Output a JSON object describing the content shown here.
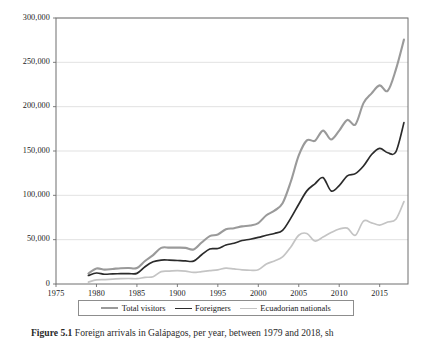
{
  "figure": {
    "caption_label": "Figure 5.1",
    "caption_text": "Foreign arrivals in Galápagos, per year, between 1979 and 2018, sh"
  },
  "legend": {
    "position": "below-axis",
    "boxed": true,
    "entries": [
      {
        "label": "Total visitors",
        "color": "#9a9a9a"
      },
      {
        "label": "Foreigners",
        "color": "#2b2b2b"
      },
      {
        "label": "Ecuadorian nationals",
        "color": "#c4c4c4"
      }
    ]
  },
  "chart_data": {
    "type": "line",
    "title": "",
    "xlabel": "",
    "ylabel": "",
    "xlim": [
      1975,
      2018.5
    ],
    "ylim": [
      0,
      300000
    ],
    "grid": "horizontal",
    "xticks": [
      1975,
      1980,
      1985,
      1990,
      1995,
      2000,
      2005,
      2010,
      2015
    ],
    "xtick_labels": [
      "1975",
      "1980",
      "1985",
      "1900",
      "1995",
      "2000",
      "2005",
      "2010",
      "2015"
    ],
    "yticks": [
      0,
      50000,
      100000,
      150000,
      200000,
      250000,
      300000
    ],
    "ytick_labels": [
      "0",
      "50,000",
      "100,000",
      "150,000",
      "200,000",
      "250,000",
      "300,000"
    ],
    "x": [
      1979,
      1980,
      1981,
      1982,
      1983,
      1984,
      1985,
      1986,
      1987,
      1988,
      1989,
      1990,
      1991,
      1992,
      1993,
      1994,
      1995,
      1996,
      1997,
      1998,
      1999,
      2000,
      2001,
      2002,
      2003,
      2004,
      2005,
      2006,
      2007,
      2008,
      2009,
      2010,
      2011,
      2012,
      2013,
      2014,
      2015,
      2016,
      2017,
      2018
    ],
    "series": [
      {
        "name": "Total visitors",
        "color": "#9a9a9a",
        "width": 2.1,
        "values": [
          11765,
          17445,
          16265,
          17000,
          17800,
          18000,
          18000,
          26000,
          32595,
          40745,
          41000,
          41000,
          40765,
          39000,
          46800,
          54000,
          55800,
          61800,
          62800,
          65000,
          66000,
          68765,
          77500,
          82765,
          91000,
          115000,
          145000,
          162000,
          161500,
          173000,
          163000,
          173000,
          185000,
          180000,
          204000,
          215000,
          224000,
          218000,
          241800,
          275600
        ]
      },
      {
        "name": "Foreigners",
        "color": "#2b2b2b",
        "width": 1.7,
        "values": [
          9600,
          12400,
          11000,
          11500,
          11600,
          11800,
          12000,
          19500,
          25000,
          27000,
          27000,
          26500,
          26000,
          25800,
          33000,
          39500,
          40000,
          44000,
          46000,
          49000,
          50500,
          52500,
          55000,
          57000,
          60500,
          74000,
          90000,
          105000,
          113000,
          120000,
          105000,
          111000,
          122000,
          124500,
          133000,
          146000,
          153000,
          148000,
          149000,
          182000
        ]
      },
      {
        "name": "Ecuadorian nationals",
        "color": "#c4c4c4",
        "width": 1.7,
        "values": [
          2100,
          4600,
          5000,
          5500,
          6000,
          6200,
          6000,
          7500,
          8200,
          14000,
          14500,
          15000,
          14500,
          13000,
          14000,
          15000,
          16000,
          18000,
          17000,
          16000,
          15500,
          16000,
          22500,
          26000,
          30500,
          41500,
          55000,
          57000,
          48500,
          53000,
          58000,
          62000,
          63000,
          55000,
          71000,
          69000,
          66500,
          70000,
          73000,
          93000
        ]
      }
    ]
  }
}
